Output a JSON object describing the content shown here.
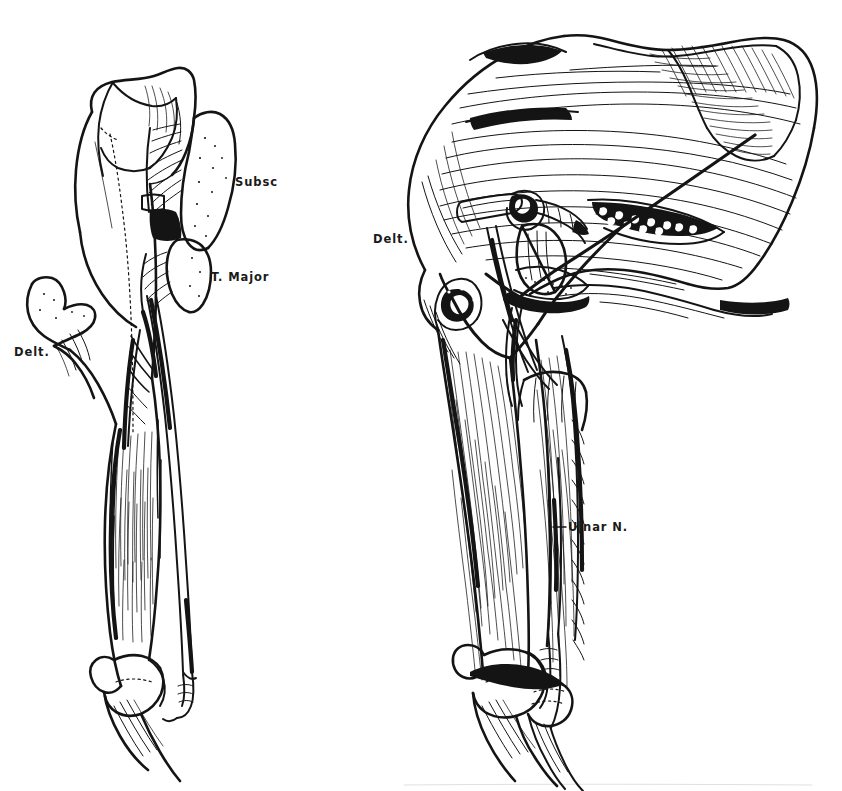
{
  "plate": {
    "kind": "anatomical-line-drawing",
    "background_color": "#ffffff",
    "ink_color": "#141414",
    "width": 842,
    "height": 791,
    "figure_count": 2
  },
  "figures": [
    {
      "id": "left-figure",
      "name": "anterior-arm-dissection",
      "position": "left",
      "labels": [
        "subsc",
        "t-major",
        "delt"
      ]
    },
    {
      "id": "right-figure",
      "name": "posterior-shoulder-dissection",
      "position": "right",
      "labels": [
        "delt",
        "ulnar-n"
      ]
    }
  ],
  "labels": {
    "subsc": {
      "text": "Subsc",
      "x": 235,
      "y": 186
    },
    "t_major": {
      "text": "T. Major",
      "x": 211,
      "y": 281
    },
    "delt_left": {
      "text": "Delt.",
      "x": 14,
      "y": 356
    },
    "delt_right": {
      "text": "Delt.",
      "x": 373,
      "y": 243
    },
    "ulnar_n": {
      "text": "Ulnar N.",
      "x": 568,
      "y": 531
    }
  }
}
